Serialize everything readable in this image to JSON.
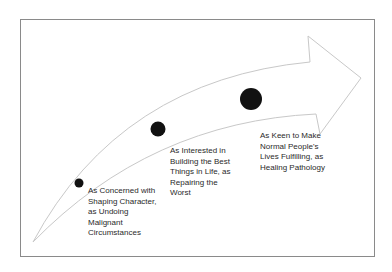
{
  "diagram": {
    "type": "progression-arrow",
    "colors": {
      "frame_border": "#8a8a8a",
      "arrow_outline": "#c8c8c8",
      "dot": "#111111",
      "text": "#2a2a2a"
    },
    "stages": [
      {
        "dot_size": "small",
        "lines": [
          "As Concerned with",
          "Shaping Character,",
          "as Undoing",
          "Malignant",
          "Circumstances"
        ]
      },
      {
        "dot_size": "medium",
        "lines": [
          "As Interested in",
          "Building the Best",
          "Things in Life, as",
          "Repairing the",
          "Worst"
        ]
      },
      {
        "dot_size": "large",
        "lines": [
          "As Keen to Make",
          "Normal People's",
          "Lives Fulfilling, as",
          "Healing Pathology"
        ]
      }
    ]
  }
}
